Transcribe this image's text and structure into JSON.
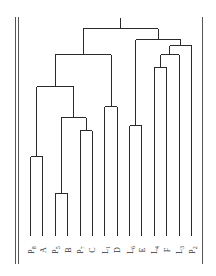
{
  "chart_data": {
    "type": "dendrogram",
    "title": "",
    "orientation": "vertical",
    "leaves": [
      {
        "id": "P8",
        "base": "P",
        "sub": "8"
      },
      {
        "id": "A",
        "base": "A",
        "sub": ""
      },
      {
        "id": "P5",
        "base": "P",
        "sub": "5"
      },
      {
        "id": "B",
        "base": "B",
        "sub": ""
      },
      {
        "id": "P7",
        "base": "P",
        "sub": "7"
      },
      {
        "id": "C",
        "base": "C",
        "sub": ""
      },
      {
        "id": "L1",
        "base": "L",
        "sub": "1"
      },
      {
        "id": "D",
        "base": "D",
        "sub": ""
      },
      {
        "id": "L6",
        "base": "L",
        "sub": "6"
      },
      {
        "id": "E",
        "base": "E",
        "sub": ""
      },
      {
        "id": "L4",
        "base": "L",
        "sub": "4"
      },
      {
        "id": "F",
        "base": "F",
        "sub": ""
      },
      {
        "id": "L3",
        "base": "L",
        "sub": "3"
      },
      {
        "id": "P2",
        "base": "P",
        "sub": "2"
      }
    ],
    "merges": [
      {
        "id": "n1",
        "children": [
          "P5",
          "B"
        ],
        "height": 0.2
      },
      {
        "id": "n2",
        "children": [
          "P8",
          "A"
        ],
        "height": 0.37
      },
      {
        "id": "n3",
        "children": [
          "L6",
          "E"
        ],
        "height": 0.51
      },
      {
        "id": "n4",
        "children": [
          "P7",
          "C"
        ],
        "height": 0.49
      },
      {
        "id": "n5",
        "children": [
          "n1",
          "n4"
        ],
        "height": 0.55
      },
      {
        "id": "n6",
        "children": [
          "L1",
          "D"
        ],
        "height": 0.6
      },
      {
        "id": "n7",
        "children": [
          "n2",
          "n5"
        ],
        "height": 0.69
      },
      {
        "id": "n8",
        "children": [
          "L4",
          "F"
        ],
        "height": 0.78
      },
      {
        "id": "n9",
        "children": [
          "n7",
          "n6"
        ],
        "height": 0.84
      },
      {
        "id": "n10",
        "children": [
          "n8",
          "L3"
        ],
        "height": 0.84
      },
      {
        "id": "n11",
        "children": [
          "n10",
          "P2"
        ],
        "height": 0.88
      },
      {
        "id": "n12",
        "children": [
          "n3",
          "n11"
        ],
        "height": 0.91
      },
      {
        "id": "n13",
        "children": [
          "n9",
          "n12"
        ],
        "height": 0.96
      }
    ],
    "xlabel": "",
    "ylabel": "",
    "ylim": [
      0,
      1
    ],
    "grid": false,
    "legend": "none"
  }
}
